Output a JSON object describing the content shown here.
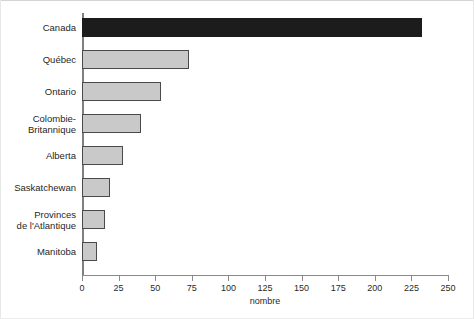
{
  "chart_data": {
    "type": "bar",
    "orientation": "horizontal",
    "title": "",
    "xlabel": "nombre",
    "ylabel": "",
    "xlim": [
      0,
      250
    ],
    "xticks": [
      0,
      25,
      50,
      75,
      100,
      125,
      150,
      175,
      200,
      225,
      250
    ],
    "xtick_labels": [
      "0",
      "25",
      "50",
      "75",
      "100",
      "125",
      "150",
      "175",
      "200",
      "225",
      "250"
    ],
    "grid": false,
    "legend": false,
    "categories": [
      "Canada",
      "Québec",
      "Ontario",
      "Colombie-Britannique",
      "Alberta",
      "Saskatchewan",
      "Provinces de l'Atlantique",
      "Manitoba"
    ],
    "category_label_lines": [
      [
        "Canada"
      ],
      [
        "Québec"
      ],
      [
        "Ontario"
      ],
      [
        "Colombie-",
        "Britannique"
      ],
      [
        "Alberta"
      ],
      [
        "Saskatchewan"
      ],
      [
        "Provinces",
        "de l'Atlantique"
      ],
      [
        "Manitoba"
      ]
    ],
    "values": [
      232,
      73,
      54,
      40,
      28,
      19,
      16,
      10
    ],
    "bar_colors": [
      "#1c1c1c",
      "#c9c9c9",
      "#c9c9c9",
      "#c9c9c9",
      "#c9c9c9",
      "#c9c9c9",
      "#c9c9c9",
      "#c9c9c9"
    ],
    "bar_edge_color": "#4a4a4a",
    "highlight_category": "Canada"
  },
  "axis": {
    "value_label": "nombre"
  },
  "colors": {
    "bar_fill": "#c9c9c9",
    "bar_edge": "#4a4a4a",
    "bar_highlight": "#1c1c1c",
    "axis": "#8a8a8a",
    "text": "#1f1f1f",
    "background": "#ffffff"
  }
}
